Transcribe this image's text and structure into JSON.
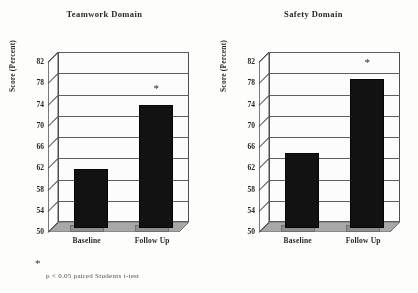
{
  "figure": {
    "footnote_marker": "*",
    "footnote_text": "p < 0.05 paired Students t-test",
    "axis_color": "#4a4a4a",
    "bar_color": "#0d0d0d",
    "background": "#fdfdfb"
  },
  "chart_data": [
    {
      "type": "bar",
      "title": "Teamwork Domain",
      "xlabel": "",
      "ylabel": "Score (Percent)",
      "categories": [
        "Baseline",
        "Follow Up"
      ],
      "values": [
        61,
        73
      ],
      "ylim": [
        50,
        82
      ],
      "yticks": [
        50,
        54,
        58,
        62,
        66,
        70,
        74,
        78,
        82
      ],
      "grid": true,
      "legend": "none",
      "annotations": [
        {
          "category": "Follow Up",
          "text": "*",
          "meaning": "p < 0.05 paired Students t-test"
        }
      ]
    },
    {
      "type": "bar",
      "title": "Safety Domain",
      "xlabel": "",
      "ylabel": "Score (Percent)",
      "categories": [
        "Baseline",
        "Follow Up"
      ],
      "values": [
        64,
        78
      ],
      "ylim": [
        50,
        82
      ],
      "yticks": [
        50,
        54,
        58,
        62,
        66,
        70,
        74,
        78,
        82
      ],
      "grid": true,
      "legend": "none",
      "annotations": [
        {
          "category": "Follow Up",
          "text": "*",
          "meaning": "p < 0.05 paired Students t-test"
        }
      ]
    }
  ]
}
